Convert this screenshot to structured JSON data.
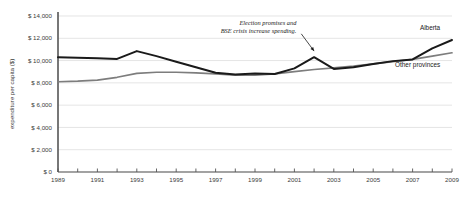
{
  "chart_data": {
    "type": "line",
    "title": "",
    "xlabel": "",
    "ylabel": "expenditure per capita ($)",
    "xlim": [
      1989,
      2009
    ],
    "ylim": [
      0,
      14000
    ],
    "grid": true,
    "legend_position": "inline-right",
    "x": [
      1989,
      1990,
      1991,
      1992,
      1993,
      1994,
      1995,
      1996,
      1997,
      1998,
      1999,
      2000,
      2001,
      2002,
      2003,
      2004,
      2005,
      2006,
      2007,
      2008,
      2009
    ],
    "ytick_labels": [
      "$ 0",
      "$ 2,000",
      "$ 4,000",
      "$ 6,000",
      "$ 8,000",
      "$ 10,000",
      "$ 12,000",
      "$ 14,000"
    ],
    "ytick_values": [
      0,
      2000,
      4000,
      6000,
      8000,
      10000,
      12000,
      14000
    ],
    "xtick_labels": [
      "1989",
      "1991",
      "1993",
      "1995",
      "1997",
      "1999",
      "2001",
      "2003",
      "2005",
      "2007",
      "2009"
    ],
    "xtick_values": [
      1989,
      1991,
      1993,
      1995,
      1997,
      1999,
      2001,
      2003,
      2005,
      2007,
      2009
    ],
    "series": [
      {
        "name": "Alberta",
        "color": "#1a1a1a",
        "label_x": 2008.4,
        "label_y": 12750,
        "values": [
          10300,
          10250,
          10200,
          10150,
          10850,
          10400,
          9900,
          9400,
          8900,
          8750,
          8850,
          8800,
          9300,
          10300,
          9250,
          9400,
          9700,
          9950,
          10100,
          11100,
          11850
        ]
      },
      {
        "name": "Other provinces",
        "color": "#7d7d7d",
        "label_x": 2008.4,
        "label_y": 9450,
        "values": [
          8100,
          8150,
          8250,
          8500,
          8850,
          8950,
          8950,
          8900,
          8800,
          8700,
          8700,
          8800,
          9000,
          9200,
          9350,
          9500,
          9700,
          9900,
          10100,
          10400,
          10700
        ]
      }
    ],
    "annotations": [
      {
        "name": "election-promises-note",
        "lines": [
          "Election promises and",
          "BSE crisis increase spending."
        ],
        "text_x": 2001.1,
        "text_y": 13200,
        "arrow_from_x": 2001.35,
        "arrow_from_y": 12400,
        "arrow_to_x": 2002.0,
        "arrow_to_y": 10850
      }
    ],
    "colors": {
      "alberta": "#1a1a1a",
      "other_provinces": "#7d7d7d",
      "grid": "#d8d8d8",
      "axis": "#555555",
      "text": "#3b3b3b",
      "background": "#ffffff"
    }
  }
}
